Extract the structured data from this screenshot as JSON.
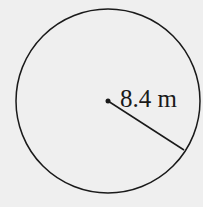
{
  "diagram": {
    "shape": "circle",
    "radius_label": "8.4 m",
    "colors": {
      "background": "#efefef",
      "stroke": "#1a1a1a"
    }
  }
}
